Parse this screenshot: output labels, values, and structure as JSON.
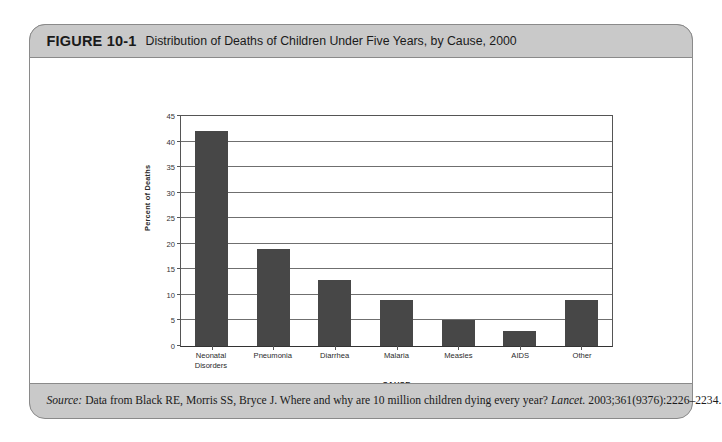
{
  "figure": {
    "number": "FIGURE 10-1",
    "title": "Distribution of Deaths of Children Under Five Years, by Cause, 2000"
  },
  "source": {
    "label": "Source:",
    "text_before": "Data from Black RE, Morris SS, Bryce J. Where and why are 10 million children dying every year?",
    "journal": "Lancet.",
    "citation": "2003;361(9376):2226–2234."
  },
  "chart_data": {
    "type": "bar",
    "title": "",
    "categories": [
      "Neonatal Disorders",
      "Pneumonia",
      "Diarrhea",
      "Malaria",
      "Measles",
      "AIDS",
      "Other"
    ],
    "category_lines": [
      [
        "Neonatal",
        "Disorders"
      ],
      [
        "Pneumonia"
      ],
      [
        "Diarrhea"
      ],
      [
        "Malaria"
      ],
      [
        "Measles"
      ],
      [
        "AIDS"
      ],
      [
        "Other"
      ]
    ],
    "values": [
      42,
      19,
      13,
      9,
      5,
      3,
      9
    ],
    "xlabel": "CAUSE",
    "ylabel": "Percent of Deaths",
    "ylim": [
      0,
      45
    ],
    "yticks": [
      0,
      5,
      10,
      15,
      20,
      25,
      30,
      35,
      40,
      45
    ],
    "ytick_labels": [
      "0",
      "5",
      "10",
      "15",
      "20",
      "25",
      "30",
      "35",
      "40",
      "45"
    ],
    "grid": true,
    "legend": false,
    "bar_color": "#474747"
  }
}
